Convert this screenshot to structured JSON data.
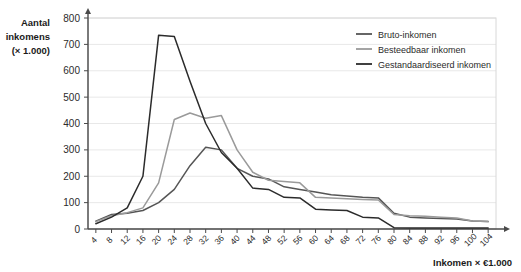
{
  "chart_data": {
    "type": "line",
    "title": "",
    "xlabel": "Inkomen × €1.000",
    "ylabel_line1": "Aantal",
    "ylabel_line2": "inkomens",
    "ylabel_line3": "(× 1.000)",
    "ylim": [
      0,
      800
    ],
    "xlim": [
      2,
      106
    ],
    "grid": true,
    "legend_position": "top-right",
    "y_ticks": [
      0,
      100,
      200,
      300,
      400,
      500,
      600,
      700,
      800
    ],
    "x_ticks": [
      4,
      8,
      12,
      16,
      20,
      24,
      28,
      32,
      36,
      40,
      44,
      48,
      52,
      56,
      60,
      64,
      68,
      72,
      76,
      80,
      84,
      88,
      92,
      96,
      100,
      104
    ],
    "x": [
      4,
      8,
      12,
      16,
      20,
      24,
      28,
      32,
      36,
      40,
      44,
      48,
      52,
      56,
      60,
      64,
      68,
      72,
      76,
      80,
      84,
      88,
      92,
      96,
      100,
      104
    ],
    "series": [
      {
        "name": "Bruto-inkomen",
        "color": "#555555",
        "values": [
          30,
          55,
          60,
          70,
          100,
          150,
          240,
          310,
          300,
          230,
          200,
          190,
          160,
          150,
          140,
          130,
          125,
          120,
          118,
          60,
          45,
          42,
          40,
          38,
          30,
          28
        ]
      },
      {
        "name": "Besteedbaar inkomen",
        "color": "#9a9a9a",
        "values": [
          28,
          50,
          62,
          80,
          175,
          415,
          440,
          420,
          430,
          300,
          215,
          185,
          180,
          175,
          120,
          118,
          115,
          112,
          110,
          55,
          50,
          48,
          45,
          42,
          30,
          28
        ]
      },
      {
        "name": "Gestandaardiseerd inkomen",
        "color": "#2b2b2b",
        "values": [
          20,
          45,
          80,
          200,
          735,
          730,
          560,
          400,
          290,
          230,
          155,
          150,
          120,
          118,
          75,
          72,
          70,
          45,
          42,
          5,
          4,
          4,
          4,
          4,
          4,
          4
        ]
      }
    ],
    "legend": [
      {
        "label": "Bruto-inkomen",
        "color": "#555555"
      },
      {
        "label": "Besteedbaar inkomen",
        "color": "#9a9a9a"
      },
      {
        "label": "Gestandaardiseerd inkomen",
        "color": "#2b2b2b"
      }
    ]
  }
}
